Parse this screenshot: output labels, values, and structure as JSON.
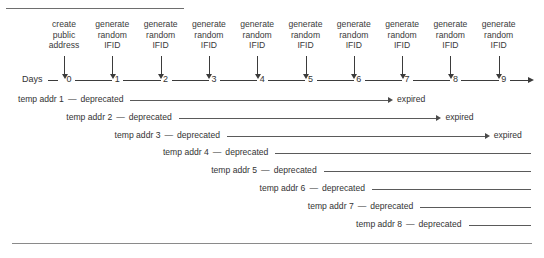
{
  "figure": {
    "header_fragment": "",
    "axis_label": "Days",
    "ticks": [
      "0",
      "1",
      "2",
      "3",
      "4",
      "5",
      "6",
      "7",
      "8",
      "9"
    ],
    "events": [
      {
        "caption": "create\npublic\naddress",
        "tick": 0
      },
      {
        "caption": "generate\nrandom\nIFID",
        "tick": 1
      },
      {
        "caption": "generate\nrandom\nIFID",
        "tick": 2
      },
      {
        "caption": "generate\nrandom\nIFID",
        "tick": 3
      },
      {
        "caption": "generate\nrandom\nIFID",
        "tick": 4
      },
      {
        "caption": "generate\nrandom\nIFID",
        "tick": 5
      },
      {
        "caption": "generate\nrandom\nIFID",
        "tick": 6
      },
      {
        "caption": "generate\nrandom\nIFID",
        "tick": 7
      },
      {
        "caption": "generate\nrandom\nIFID",
        "tick": 8
      },
      {
        "caption": "generate\nrandom\nIFID",
        "tick": 9
      }
    ],
    "rows": [
      {
        "label": "temp addr 1",
        "dash": "—",
        "state": "deprecated",
        "start_tick": 0,
        "end_label": "expired",
        "end_tick": 7,
        "truncated": false
      },
      {
        "label": "temp addr 2",
        "dash": "—",
        "state": "deprecated",
        "start_tick": 1,
        "end_label": "expired",
        "end_tick": 8,
        "truncated": false
      },
      {
        "label": "temp addr 3",
        "dash": "—",
        "state": "deprecated",
        "start_tick": 2,
        "end_label": "expired",
        "end_tick": 9,
        "truncated": false
      },
      {
        "label": "temp addr 4",
        "dash": "—",
        "state": "deprecated",
        "start_tick": 3,
        "end_label": "",
        "end_tick": 10,
        "truncated": true
      },
      {
        "label": "temp addr 5",
        "dash": "—",
        "state": "deprecated",
        "start_tick": 4,
        "end_label": "",
        "end_tick": 10,
        "truncated": true
      },
      {
        "label": "temp addr 6",
        "dash": "—",
        "state": "deprecated",
        "start_tick": 5,
        "end_label": "",
        "end_tick": 10,
        "truncated": true
      },
      {
        "label": "temp addr 7",
        "dash": "—",
        "state": "deprecated",
        "start_tick": 6,
        "end_label": "",
        "end_tick": 10,
        "truncated": true
      },
      {
        "label": "temp addr 8",
        "dash": "—",
        "state": "deprecated",
        "start_tick": 7,
        "end_label": "",
        "end_tick": 10,
        "truncated": true
      }
    ],
    "colors": {
      "ink": "#333333",
      "line": "#5a5a5a",
      "rule": "#8a8a8a",
      "background": "#ffffff"
    }
  }
}
